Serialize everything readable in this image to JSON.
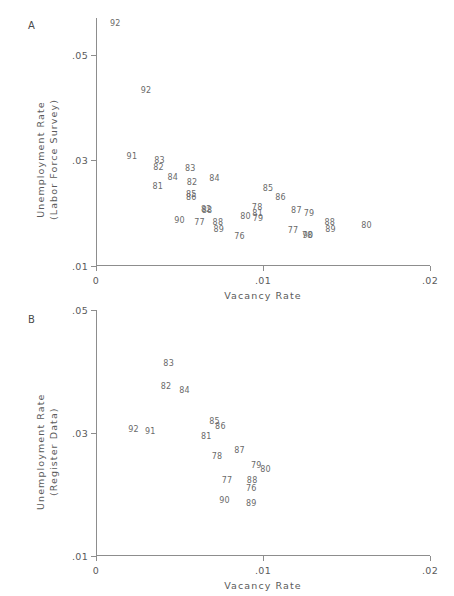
{
  "figure": {
    "panels": [
      {
        "id": "A",
        "letter": "A",
        "ylabel_line1": "Unemployment Rate",
        "ylabel_line2": "(Labor Force Survey)",
        "xlabel": "Vacancy Rate",
        "yticks": [
          ".05",
          ".03",
          ".01"
        ],
        "xticks": [
          "0",
          ".01",
          ".02"
        ]
      },
      {
        "id": "B",
        "letter": "B",
        "ylabel_line1": "Unemployment Rate",
        "ylabel_line2": "(Register Data)",
        "xlabel": "Vacancy Rate",
        "yticks": [
          ".05",
          ".03",
          ".01"
        ],
        "xticks": [
          "0",
          ".01",
          ".02"
        ]
      }
    ]
  },
  "chart_data": [
    {
      "type": "scatter",
      "panel": "A",
      "title": "",
      "xlabel": "Vacancy Rate",
      "ylabel": "Unemployment Rate (Labor Force Survey)",
      "xlim": [
        0,
        0.02
      ],
      "ylim": [
        0.01,
        0.057
      ],
      "xticks": [
        0,
        0.01,
        0.02
      ],
      "xticklabels": [
        "0",
        ".01",
        ".02"
      ],
      "yticks": [
        0.05,
        0.03,
        0.01
      ],
      "yticklabels": [
        ".05",
        ".03",
        ".01"
      ],
      "grid": false,
      "legend": false,
      "marker_style": "text-label",
      "points": [
        {
          "label": "92",
          "x": 0.00115,
          "y": 0.0558
        },
        {
          "label": "92",
          "x": 0.003,
          "y": 0.0432
        },
        {
          "label": "91",
          "x": 0.00215,
          "y": 0.0307
        },
        {
          "label": "83",
          "x": 0.0038,
          "y": 0.0299
        },
        {
          "label": "82",
          "x": 0.00375,
          "y": 0.0285
        },
        {
          "label": "83",
          "x": 0.00565,
          "y": 0.0283
        },
        {
          "label": "84",
          "x": 0.0046,
          "y": 0.0266
        },
        {
          "label": "84",
          "x": 0.0071,
          "y": 0.0265
        },
        {
          "label": "82",
          "x": 0.00575,
          "y": 0.0258
        },
        {
          "label": "81",
          "x": 0.0037,
          "y": 0.0249
        },
        {
          "label": "85",
          "x": 0.0103,
          "y": 0.0246
        },
        {
          "label": "85",
          "x": 0.0057,
          "y": 0.0234
        },
        {
          "label": "86",
          "x": 0.0057,
          "y": 0.0228
        },
        {
          "label": "86",
          "x": 0.01105,
          "y": 0.0229
        },
        {
          "label": "82",
          "x": 0.0066,
          "y": 0.0207
        },
        {
          "label": "88",
          "x": 0.00665,
          "y": 0.0205
        },
        {
          "label": "78",
          "x": 0.00965,
          "y": 0.0209
        },
        {
          "label": "87",
          "x": 0.012,
          "y": 0.0205
        },
        {
          "label": "81",
          "x": 0.00968,
          "y": 0.0199
        },
        {
          "label": "79",
          "x": 0.01275,
          "y": 0.0199
        },
        {
          "label": "79",
          "x": 0.0097,
          "y": 0.019
        },
        {
          "label": "80",
          "x": 0.00895,
          "y": 0.0192
        },
        {
          "label": "90",
          "x": 0.005,
          "y": 0.0186
        },
        {
          "label": "77",
          "x": 0.0062,
          "y": 0.0181
        },
        {
          "label": "88",
          "x": 0.0073,
          "y": 0.0181
        },
        {
          "label": "88",
          "x": 0.014,
          "y": 0.0181
        },
        {
          "label": "80",
          "x": 0.0162,
          "y": 0.0176
        },
        {
          "label": "89",
          "x": 0.00735,
          "y": 0.0168
        },
        {
          "label": "89",
          "x": 0.01405,
          "y": 0.0168
        },
        {
          "label": "77",
          "x": 0.0118,
          "y": 0.0167
        },
        {
          "label": "78",
          "x": 0.01265,
          "y": 0.0157
        },
        {
          "label": "90",
          "x": 0.0127,
          "y": 0.0157
        },
        {
          "label": "76",
          "x": 0.0086,
          "y": 0.0155
        }
      ]
    },
    {
      "type": "scatter",
      "panel": "B",
      "title": "",
      "xlabel": "Vacancy Rate",
      "ylabel": "Unemployment Rate (Register Data)",
      "xlim": [
        0,
        0.02
      ],
      "ylim": [
        0.01,
        0.05
      ],
      "xticks": [
        0,
        0.01,
        0.02
      ],
      "xticklabels": [
        "0",
        ".01",
        ".02"
      ],
      "yticks": [
        0.05,
        0.03,
        0.01
      ],
      "yticklabels": [
        ".05",
        ".03",
        ".01"
      ],
      "grid": false,
      "legend": false,
      "marker_style": "text-label",
      "points": [
        {
          "label": "83",
          "x": 0.00435,
          "y": 0.0412
        },
        {
          "label": "82",
          "x": 0.0042,
          "y": 0.0375
        },
        {
          "label": "84",
          "x": 0.0053,
          "y": 0.0368
        },
        {
          "label": "85",
          "x": 0.0071,
          "y": 0.0318
        },
        {
          "label": "86",
          "x": 0.00745,
          "y": 0.031
        },
        {
          "label": "92",
          "x": 0.00225,
          "y": 0.0305
        },
        {
          "label": "91",
          "x": 0.00325,
          "y": 0.0301
        },
        {
          "label": "81",
          "x": 0.0066,
          "y": 0.0293
        },
        {
          "label": "87",
          "x": 0.0086,
          "y": 0.027
        },
        {
          "label": "78",
          "x": 0.00725,
          "y": 0.0261
        },
        {
          "label": "79",
          "x": 0.0096,
          "y": 0.0247
        },
        {
          "label": "80",
          "x": 0.01015,
          "y": 0.024
        },
        {
          "label": "77",
          "x": 0.00785,
          "y": 0.0222
        },
        {
          "label": "88",
          "x": 0.00935,
          "y": 0.0222
        },
        {
          "label": "76",
          "x": 0.0093,
          "y": 0.0209
        },
        {
          "label": "90",
          "x": 0.0077,
          "y": 0.0189
        },
        {
          "label": "89",
          "x": 0.0093,
          "y": 0.0184
        }
      ]
    }
  ]
}
